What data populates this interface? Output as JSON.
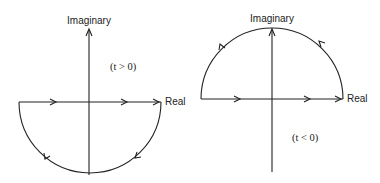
{
  "diagrams": [
    {
      "name": "contour-t-positive",
      "condition": "(t > 0)",
      "axis_labels": {
        "vertical": "Imaginary",
        "horizontal": "Real"
      },
      "contour": "lower semicircle, clockwise"
    },
    {
      "name": "contour-t-negative",
      "condition": "(t < 0)",
      "axis_labels": {
        "vertical": "Imaginary",
        "horizontal": "Real"
      },
      "contour": "upper semicircle, counterclockwise"
    }
  ]
}
